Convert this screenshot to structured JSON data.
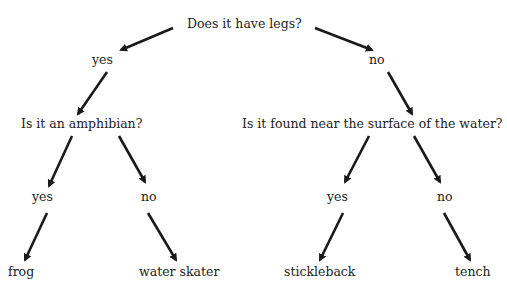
{
  "diagram": {
    "type": "decision-tree",
    "root": {
      "question": "Does it have legs?"
    },
    "branches": {
      "left_answer": "yes",
      "right_answer": "no"
    },
    "left_question": "Is it an amphibian?",
    "right_question": "Is it found near the surface of the water?",
    "left_sub": {
      "yes": "yes",
      "no": "no"
    },
    "right_sub": {
      "yes": "yes",
      "no": "no"
    },
    "leaves": [
      "frog",
      "water skater",
      "stickleback",
      "tench"
    ],
    "colors": {
      "text": "#222222",
      "arrow": "#1a1a1a",
      "background": "#ffffff"
    }
  }
}
